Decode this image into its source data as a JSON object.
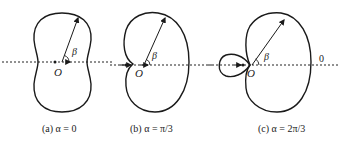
{
  "figures": [
    {
      "id": "a",
      "caption": "(a) α = 0",
      "origin_label": "O",
      "angle_label": "β",
      "alpha": "0"
    },
    {
      "id": "b",
      "caption": "(b) α = π/3",
      "origin_label": "O",
      "angle_label": "β",
      "alpha": "π/3"
    },
    {
      "id": "c",
      "caption": "(c) α = 2π/3",
      "origin_label": "O",
      "angle_label": "β",
      "alpha": "2π/3",
      "axis_end_label": "0"
    }
  ],
  "colors": {
    "stroke": "#1a1a1a",
    "background": "#ffffff"
  }
}
